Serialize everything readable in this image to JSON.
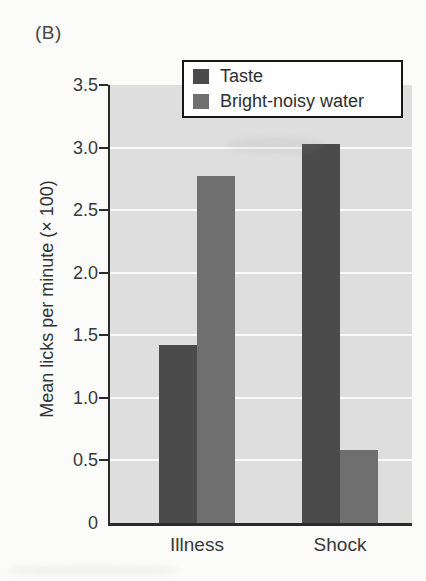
{
  "chart_data": {
    "type": "bar",
    "panel_label": "(B)",
    "title": "",
    "xlabel": "",
    "ylabel": "Mean licks per minute (× 100)",
    "categories": [
      "Illness",
      "Shock"
    ],
    "series": [
      {
        "name": "Taste",
        "color": "#4b4b4b",
        "values": [
          1.42,
          3.03
        ]
      },
      {
        "name": "Bright-noisy water",
        "color": "#6f6f6f",
        "values": [
          2.77,
          0.58
        ]
      }
    ],
    "ylim": [
      0,
      3.5
    ],
    "ytick_step": 0.5,
    "yticks": [
      "0",
      "0.5",
      "1.0",
      "1.5",
      "2.0",
      "2.5",
      "3.0",
      "3.5"
    ],
    "grid": true,
    "gridline_color": "#fafafa",
    "plot_background": "#dedede",
    "axis_color": "#2b2b2b",
    "legend_position": "top"
  }
}
